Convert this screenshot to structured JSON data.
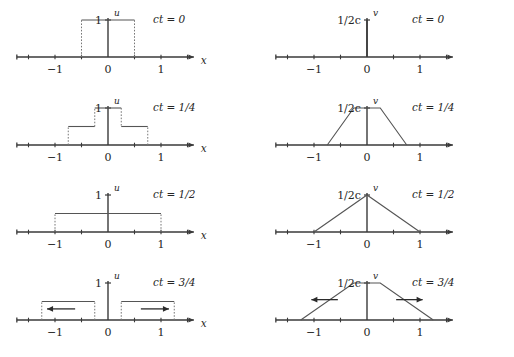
{
  "figure": {
    "axis_color": "#3a3a3a",
    "curve_color": "#555555",
    "dash_color": "#777777",
    "text_color": "#262626"
  },
  "rows": [
    {
      "time_label": "ct = 0",
      "left": {
        "axis_x_label": "x",
        "func_label": "u",
        "value_label": "1",
        "ticks": [
          {
            "value": -1,
            "label": "−1"
          },
          {
            "value": 0,
            "label": "0"
          },
          {
            "value": 1,
            "label": "1"
          }
        ],
        "shape": "box",
        "box": {
          "left": -0.5,
          "right": 0.5,
          "height": 1.0
        },
        "arrows": []
      },
      "right": {
        "axis_x_label": "",
        "func_label": "v",
        "value_label": "1/2c",
        "ticks": [
          {
            "value": -1,
            "label": "−1"
          },
          {
            "value": 0,
            "label": "0"
          },
          {
            "value": 1,
            "label": "1"
          }
        ],
        "shape": "spike",
        "polyline": [],
        "arrows": []
      }
    },
    {
      "time_label": "ct = 1/4",
      "left": {
        "axis_x_label": "x",
        "func_label": "u",
        "value_label": "1",
        "ticks": [
          {
            "value": -1,
            "label": "−1"
          },
          {
            "value": 0,
            "label": "0"
          },
          {
            "value": 1,
            "label": "1"
          }
        ],
        "shape": "steps",
        "steps": [
          {
            "left": -0.75,
            "right": -0.25,
            "height": 0.5
          },
          {
            "left": -0.25,
            "right": 0.25,
            "height": 1.0
          },
          {
            "left": 0.25,
            "right": 0.75,
            "height": 0.5
          }
        ],
        "arrows": []
      },
      "right": {
        "axis_x_label": "",
        "func_label": "v",
        "value_label": "1/2c",
        "ticks": [
          {
            "value": -1,
            "label": "−1"
          },
          {
            "value": 0,
            "label": "0"
          },
          {
            "value": 1,
            "label": "1"
          }
        ],
        "shape": "polyline",
        "polyline": [
          {
            "x": -0.75,
            "y": 0.0
          },
          {
            "x": -0.25,
            "y": 1.0
          },
          {
            "x": 0.25,
            "y": 1.0
          },
          {
            "x": 0.75,
            "y": 0.0
          }
        ],
        "arrows": []
      }
    },
    {
      "time_label": "ct = 1/2",
      "left": {
        "axis_x_label": "x",
        "func_label": "u",
        "value_label": "1",
        "ticks": [
          {
            "value": -1,
            "label": "−1"
          },
          {
            "value": 0,
            "label": "0"
          },
          {
            "value": 1,
            "label": "1"
          }
        ],
        "shape": "box",
        "box": {
          "left": -1.0,
          "right": 1.0,
          "height": 0.5
        },
        "arrows": []
      },
      "right": {
        "axis_x_label": "",
        "func_label": "v",
        "value_label": "1/2c",
        "ticks": [
          {
            "value": -1,
            "label": "−1"
          },
          {
            "value": 0,
            "label": "0"
          },
          {
            "value": 1,
            "label": "1"
          }
        ],
        "shape": "polyline",
        "polyline": [
          {
            "x": -1.0,
            "y": 0.0
          },
          {
            "x": 0.0,
            "y": 1.0
          },
          {
            "x": 1.0,
            "y": 0.0
          }
        ],
        "arrows": []
      }
    },
    {
      "time_label": "ct = 3/4",
      "left": {
        "axis_x_label": "x",
        "func_label": "u",
        "value_label": "1",
        "ticks": [
          {
            "value": -1,
            "label": "−1"
          },
          {
            "value": 0,
            "label": "0"
          },
          {
            "value": 1,
            "label": "1"
          }
        ],
        "shape": "steps",
        "steps": [
          {
            "left": -1.25,
            "right": -0.25,
            "height": 0.5
          },
          {
            "left": 0.25,
            "right": 1.25,
            "height": 0.5
          }
        ],
        "arrows": [
          {
            "direction": "left",
            "from": -0.62,
            "to": -1.15,
            "y": 0.3
          },
          {
            "direction": "right",
            "from": 0.62,
            "to": 1.15,
            "y": 0.3
          }
        ]
      },
      "right": {
        "axis_x_label": "",
        "func_label": "v",
        "value_label": "1/2c",
        "ticks": [
          {
            "value": -1,
            "label": "−1"
          },
          {
            "value": 0,
            "label": "0"
          },
          {
            "value": 1,
            "label": "1"
          }
        ],
        "shape": "polyline",
        "polyline": [
          {
            "x": -1.25,
            "y": 0.0
          },
          {
            "x": -0.25,
            "y": 1.0
          },
          {
            "x": 0.25,
            "y": 1.0
          },
          {
            "x": 1.25,
            "y": 0.0
          }
        ],
        "arrows": [
          {
            "direction": "left",
            "from": -0.55,
            "to": -1.05,
            "y": 0.55
          },
          {
            "direction": "right",
            "from": 0.55,
            "to": 1.05,
            "y": 0.55
          }
        ]
      }
    }
  ],
  "chart_data": {
    "type": "line",
    "xlabel": "x",
    "ylabel": "",
    "xlim": [
      -1.75,
      1.75
    ],
    "ylim": [
      0,
      1.25
    ],
    "grid": false,
    "legend": "none",
    "panels": [
      {
        "row": 0,
        "col": "u",
        "time": "ct = 0",
        "x": [
          -0.5,
          -0.5,
          0.5,
          0.5
        ],
        "y": [
          0,
          1,
          1,
          0
        ]
      },
      {
        "row": 0,
        "col": "v",
        "time": "ct = 0",
        "x": [
          0,
          0
        ],
        "y": [
          0,
          1
        ]
      },
      {
        "row": 1,
        "col": "u",
        "time": "ct = 1/4",
        "x": [
          -0.75,
          -0.75,
          -0.25,
          -0.25,
          0.25,
          0.25,
          0.75,
          0.75
        ],
        "y": [
          0,
          0.5,
          0.5,
          1,
          1,
          0.5,
          0.5,
          0
        ]
      },
      {
        "row": 1,
        "col": "v",
        "time": "ct = 1/4",
        "x": [
          -0.75,
          -0.25,
          0.25,
          0.75
        ],
        "y": [
          0,
          1,
          1,
          0
        ]
      },
      {
        "row": 2,
        "col": "u",
        "time": "ct = 1/2",
        "x": [
          -1,
          -1,
          1,
          1
        ],
        "y": [
          0,
          0.5,
          0.5,
          0
        ]
      },
      {
        "row": 2,
        "col": "v",
        "time": "ct = 1/2",
        "x": [
          -1,
          0,
          1
        ],
        "y": [
          0,
          1,
          0
        ]
      },
      {
        "row": 3,
        "col": "u",
        "time": "ct = 3/4",
        "x": [
          -1.25,
          -1.25,
          -0.25,
          -0.25,
          0.25,
          0.25,
          1.25,
          1.25
        ],
        "y": [
          0,
          0.5,
          0.5,
          0,
          0,
          0.5,
          0.5,
          0
        ]
      },
      {
        "row": 3,
        "col": "v",
        "time": "ct = 3/4",
        "x": [
          -1.25,
          -0.25,
          0.25,
          1.25
        ],
        "y": [
          0,
          1,
          1,
          0
        ]
      }
    ],
    "tick_labels": [
      "−1",
      "0",
      "1"
    ],
    "tick_values": [
      -1,
      0,
      1
    ],
    "u_value_label": "1",
    "v_value_label": "1/2c"
  }
}
